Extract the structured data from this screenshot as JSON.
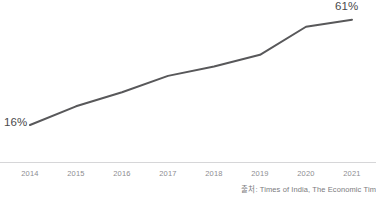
{
  "chart_data": {
    "type": "line",
    "title": "",
    "subtitle": "",
    "xlabel": "",
    "ylabel": "",
    "categories": [
      "2014",
      "2015",
      "2016",
      "2017",
      "2018",
      "2019",
      "2020",
      "2021"
    ],
    "values": [
      16,
      24,
      30,
      37,
      41,
      46,
      58,
      61
    ],
    "series": [
      {
        "name": "",
        "values": [
          16,
          24,
          30,
          37,
          41,
          46,
          58,
          61
        ]
      }
    ],
    "ylim": [
      0,
      66
    ],
    "xlim": [
      "2014",
      "2021"
    ],
    "grid": false,
    "legend": false,
    "legend_position": "none",
    "annotations": [
      {
        "name": "start-value",
        "text": "16%",
        "category": "2014",
        "value": 16
      },
      {
        "name": "end-value",
        "text": "61%",
        "category": "2021",
        "value": 61
      }
    ],
    "colors": {
      "line": "#58585a",
      "axis": "#d6d6d8",
      "tick_label": "#8d8d90",
      "value_label": "#4a4a4c",
      "source_text": "#7b7b7e",
      "background": "#ffffff"
    },
    "line_width_px": 2
  },
  "labels": {
    "start_value": "16%",
    "end_value": "61%"
  },
  "axis": {
    "ticks": [
      "2014",
      "2015",
      "2016",
      "2017",
      "2018",
      "2019",
      "2020",
      "2021"
    ]
  },
  "footer": {
    "source": "출처: Times of India, The Economic Tim"
  }
}
